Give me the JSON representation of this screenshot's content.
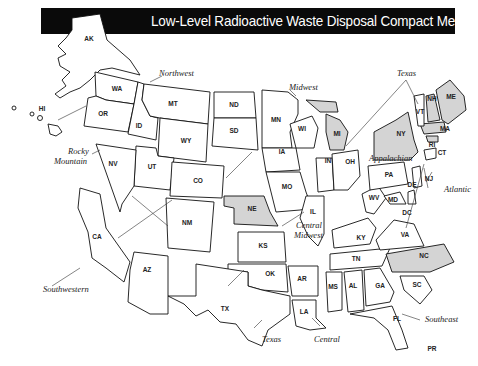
{
  "title": "Low-Level Radioactive Waste Disposal Compact Membership",
  "colors": {
    "title_bar": "#0a0a0a",
    "title_text": "#ffffff",
    "member_state_fill": "#ffffff",
    "unaffiliated_state_fill": "#d4d4d4",
    "outline": "#111111"
  },
  "compacts": [
    {
      "name": "Northwest",
      "states": [
        "AK",
        "HI",
        "WA",
        "OR",
        "ID",
        "MT",
        "UT",
        "WY"
      ]
    },
    {
      "name": "Rocky Mountain",
      "states": [
        "NV",
        "CO",
        "NM"
      ]
    },
    {
      "name": "Southwestern",
      "states": [
        "CA",
        "AZ",
        "ND",
        "SD"
      ]
    },
    {
      "name": "Midwest",
      "states": [
        "MN",
        "WI",
        "IA",
        "MO",
        "IN",
        "OH"
      ]
    },
    {
      "name": "Central Midwest",
      "states": [
        "IL",
        "KY"
      ]
    },
    {
      "name": "Central",
      "states": [
        "KS",
        "OK",
        "AR",
        "LA"
      ]
    },
    {
      "name": "Texas",
      "states": [
        "TX",
        "VT"
      ]
    },
    {
      "name": "Appalachian",
      "states": [
        "PA",
        "WV",
        "MD",
        "DE"
      ]
    },
    {
      "name": "Atlantic",
      "states": [
        "NJ",
        "CT",
        "SC"
      ]
    },
    {
      "name": "Southeast",
      "states": [
        "TN",
        "MS",
        "AL",
        "GA",
        "FL",
        "VA"
      ]
    }
  ],
  "unaffiliated_states": [
    "NE",
    "MI",
    "NY",
    "NH",
    "ME",
    "MA",
    "RI",
    "NC",
    "DC",
    "PR"
  ],
  "labels": {
    "AK": "AK",
    "HI": "HI",
    "WA": "WA",
    "OR": "OR",
    "ID": "ID",
    "MT": "MT",
    "WY": "WY",
    "UT": "UT",
    "NV": "NV",
    "CA": "CA",
    "AZ": "AZ",
    "CO": "CO",
    "NM": "NM",
    "ND": "ND",
    "SD": "SD",
    "NE": "NE",
    "KS": "KS",
    "OK": "OK",
    "TX": "TX",
    "MN": "MN",
    "IA": "IA",
    "MO": "MO",
    "AR": "AR",
    "LA": "LA",
    "WI": "WI",
    "MI": "MI",
    "IL": "IL",
    "IN": "IN",
    "OH": "OH",
    "KY": "KY",
    "TN": "TN",
    "MS": "MS",
    "AL": "AL",
    "GA": "GA",
    "FL": "FL",
    "SC": "SC",
    "NC": "NC",
    "VA": "VA",
    "WV": "WV",
    "MD": "MD",
    "DE": "DE",
    "DC": "DC",
    "PA": "PA",
    "NJ": "NJ",
    "NY": "NY",
    "CT": "CT",
    "RI": "RI",
    "MA": "MA",
    "VT": "VT",
    "NH": "NH",
    "ME": "ME",
    "PR": "PR"
  },
  "region_labels": {
    "northwest": "Northwest",
    "rocky1": "Rocky",
    "rocky2": "Mountain",
    "southwestern": "Southwestern",
    "midwest": "Midwest",
    "central_midwest1": "Central",
    "central_midwest2": "Midwest",
    "texas_top": "Texas",
    "texas_bottom": "Texas",
    "appalachian": "Appalachian",
    "atlantic": "Atlantic",
    "central": "Central",
    "southeast": "Southeast"
  }
}
